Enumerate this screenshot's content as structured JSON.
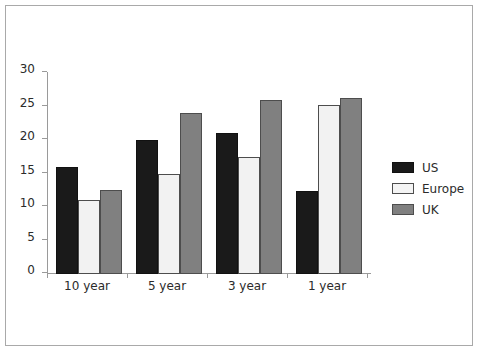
{
  "chart_data": {
    "type": "bar",
    "title": "",
    "xlabel": "",
    "ylabel": "",
    "categories": [
      "10 year",
      "5 year",
      "3 year",
      "1 year"
    ],
    "series": [
      {
        "name": "US",
        "color": "#1a1a1a",
        "values": [
          16,
          20,
          21,
          12.4
        ]
      },
      {
        "name": "Europe",
        "color": "#f2f2f2",
        "values": [
          11,
          15,
          17.4,
          25.3
        ]
      },
      {
        "name": "UK",
        "color": "#808080",
        "values": [
          12.5,
          24,
          26,
          26.3
        ]
      }
    ],
    "ylim": [
      0,
      30
    ],
    "yticks": [
      0,
      5,
      10,
      15,
      20,
      25,
      30
    ],
    "ytick_labels": [
      "0",
      "5",
      "10",
      "15",
      "20",
      "25",
      "30"
    ],
    "grid": false,
    "legend_position": "right"
  },
  "legend": {
    "entries": [
      {
        "label": "US",
        "swatch": "us"
      },
      {
        "label": "Europe",
        "swatch": "europe"
      },
      {
        "label": "UK",
        "swatch": "uk"
      }
    ]
  }
}
